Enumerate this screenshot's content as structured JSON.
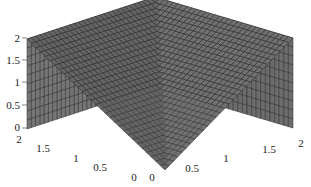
{
  "chart_data": {
    "type": "surface",
    "title": "",
    "xlabel": "",
    "ylabel": "",
    "zlabel": "",
    "x_range": [
      0,
      2
    ],
    "y_range": [
      0,
      2
    ],
    "z_range": [
      0,
      2
    ],
    "x_ticks": [
      "0",
      "0.5",
      "1",
      "1.5",
      "2"
    ],
    "y_ticks": [
      "0",
      "0.5",
      "1",
      "1.5",
      "2"
    ],
    "z_ticks": [
      "0",
      "0.5",
      "1",
      "1.5",
      "2"
    ],
    "surface_description": "mesh surface approximately z = max(x, y) sampled on a 0..2 grid, rendered grayscale",
    "grid_resolution": 30,
    "colormap": "gray",
    "face_color": "#6e6e6e",
    "edge_color": "#2a2a2a",
    "grid": false,
    "legend": "none"
  },
  "axes": {
    "z_tick_labels": [
      "2",
      "1.5",
      "1",
      "0.5",
      "0"
    ],
    "y_tick_labels": [
      "2",
      "1.5",
      "1",
      "0.5",
      "0"
    ],
    "x_tick_labels": [
      "0",
      "0.5",
      "1",
      "1.5",
      "2"
    ]
  }
}
